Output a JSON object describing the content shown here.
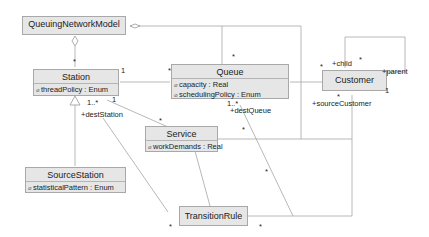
{
  "classes": {
    "qnm": {
      "name": "QueuingNetworkModel"
    },
    "station": {
      "name": "Station",
      "attrs": [
        {
          "vis": "⌀",
          "text": "threadPolicy : Enum"
        }
      ]
    },
    "queue": {
      "name": "Queue",
      "attrs": [
        {
          "vis": "⌀",
          "text": "capacity : Real"
        },
        {
          "vis": "⌀",
          "text": "schedulingPolicy : Enum"
        }
      ]
    },
    "customer": {
      "name": "Customer"
    },
    "service": {
      "name": "Service",
      "attrs": [
        {
          "vis": "⌀",
          "text": "workDemands : Real"
        }
      ]
    },
    "sourceStation": {
      "name": "SourceStation",
      "attrs": [
        {
          "vis": "⌀",
          "text": "statisticalPattern : Enum"
        }
      ]
    },
    "transitionRule": {
      "name": "TransitionRule"
    }
  },
  "roles": {
    "destStation": "+destStation",
    "destQueue": "+destQueue",
    "child": "+child",
    "parent": "+parent",
    "sourceCustomer": "+sourceCustomer"
  },
  "multiplicities": {
    "qnm_station": "*",
    "qnm_queue": "*",
    "station_queue_station": "1",
    "station_queue_queue": "*",
    "station_service_a": "1..*",
    "station_service_b": "1",
    "service_top": "*",
    "queue_dest": "1..*",
    "service_right": "*",
    "customer_left": "*",
    "customer_child": "*",
    "customer_parent": "1",
    "customer_source": "*",
    "tr_left": "*",
    "tr_right": "*",
    "tr_mid": "*"
  },
  "colors": {
    "class_fill": "#e6e6e6",
    "class_border": "#a8a8a8",
    "line": "#a0a0a0"
  }
}
